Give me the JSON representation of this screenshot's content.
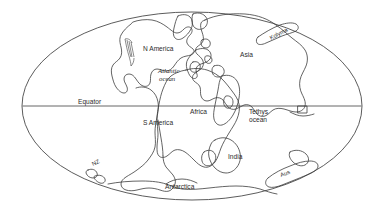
{
  "figure": {
    "kind": "paleogeographic-world-map",
    "projection": "elliptical (Mollweide-style)",
    "background_color": "#ffffff",
    "outline_color": "#3c3c3c",
    "equator_line_color": "#555555"
  },
  "labels": {
    "n_america": "N America",
    "s_america": "S America",
    "africa": "Africa",
    "asia": "Asia",
    "india": "India",
    "antarctica": "Antarctica",
    "australia": "Aus",
    "new_zealand": "NZ",
    "kolyma": "Kolyma",
    "atlantic_line1": "Atlantic",
    "atlantic_line2": "ocean",
    "tethys_line1": "Tethys",
    "tethys_line2": "ocean",
    "equator": "Equator"
  }
}
